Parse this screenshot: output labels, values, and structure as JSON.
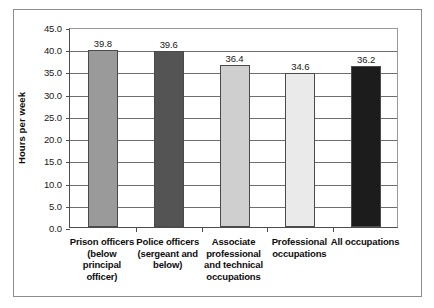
{
  "chart_data": {
    "type": "bar",
    "title": "",
    "xlabel": "",
    "ylabel": "Hours per week",
    "ylim": [
      0.0,
      45.0
    ],
    "ytick_step": 5.0,
    "ytick_labels": [
      "45.0",
      "40.0",
      "35.0",
      "30.0",
      "25.0",
      "20.0",
      "15.0",
      "10.0",
      "5.0",
      "0.0"
    ],
    "ytick_values": [
      45.0,
      40.0,
      35.0,
      30.0,
      25.0,
      20.0,
      15.0,
      10.0,
      5.0,
      0.0
    ],
    "grid": true,
    "legend": "none",
    "categories": [
      "Prison officers (below principal officer)",
      "Police officers (sergeant and below)",
      "Associate professional and technical occupations",
      "Professional occupations",
      "All occupations"
    ],
    "category_label_lines": [
      [
        "Prison officers",
        "(below",
        "principal",
        "officer)"
      ],
      [
        "Police officers",
        "(sergeant and",
        "below)"
      ],
      [
        "Associate",
        "professional",
        "and technical",
        "occupations"
      ],
      [
        "Professional",
        "occupations"
      ],
      [
        "All occupations"
      ]
    ],
    "values": [
      39.8,
      39.6,
      36.4,
      34.6,
      36.2
    ],
    "value_labels": [
      "39.8",
      "39.6",
      "36.4",
      "34.6",
      "36.2"
    ],
    "bar_colors": [
      "#9a9a9a",
      "#545454",
      "#cfcfcf",
      "#eaeaea",
      "#1c1c1c"
    ],
    "bar_border_color": "#4a4a4a"
  },
  "style": {
    "frame_border": "#8c8c8c",
    "axis_color": "#4d4d4d",
    "gridline_color": "#6e6e6e",
    "background": "#ffffff",
    "text_color": "#0d0d0d"
  }
}
